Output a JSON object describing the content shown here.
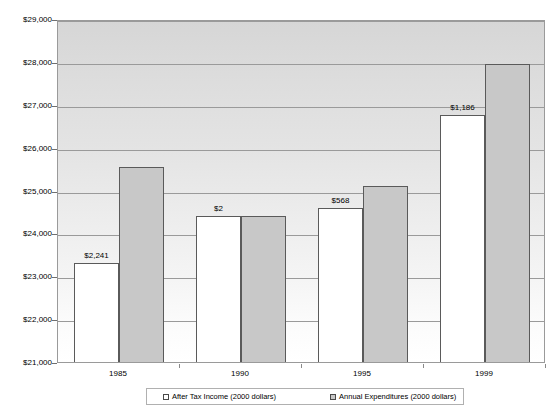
{
  "chart_data": {
    "type": "bar",
    "title": "",
    "subtitle": "",
    "xlabel": "",
    "ylabel": "",
    "categories": [
      "1985",
      "1990",
      "1995",
      "1999"
    ],
    "series": [
      {
        "name": "After Tax Income (2000 dollars)",
        "color": "#ffffff",
        "values": [
          23350,
          24450,
          24640,
          26800
        ]
      },
      {
        "name": "Annual Expenditures (2000 dollars)",
        "color": "#c8c8c8",
        "values": [
          25600,
          24452,
          25140,
          27990
        ]
      }
    ],
    "annotations": [
      {
        "category": "1985",
        "text": "$2,241"
      },
      {
        "category": "1990",
        "text": "$2"
      },
      {
        "category": "1995",
        "text": "$568"
      },
      {
        "category": "1999",
        "text": "$1,186"
      }
    ],
    "ylim": [
      21000,
      29000
    ],
    "yticks": [
      21000,
      22000,
      23000,
      24000,
      25000,
      26000,
      27000,
      28000,
      29000
    ],
    "ytick_labels": [
      "$21,000",
      "$22,000",
      "$23,000",
      "$24,000",
      "$25,000",
      "$26,000",
      "$27,000",
      "$28,000",
      "$29,000"
    ],
    "grid": true,
    "legend_position": "bottom"
  },
  "legend": {
    "items": [
      {
        "label": "After Tax Income (2000 dollars)",
        "swatch": "income"
      },
      {
        "label": "Annual Expenditures (2000 dollars)",
        "swatch": "expenditure"
      }
    ]
  }
}
